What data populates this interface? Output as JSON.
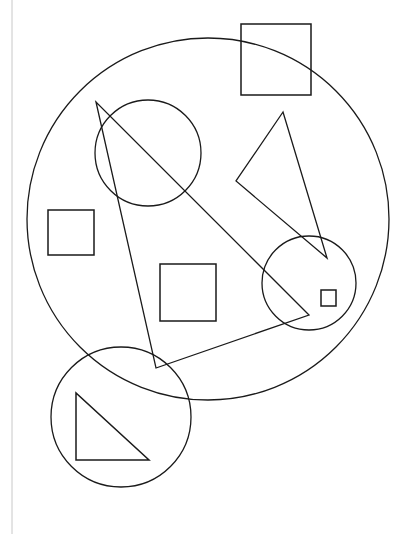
{
  "canvas": {
    "width": 408,
    "height": 534,
    "background_color": "#ffffff",
    "stroke_color": "#1a1a1a",
    "rule_color": "#c8c8c8"
  },
  "margin_rule": {
    "name": "left-margin-rule",
    "x": 12,
    "y1": 0,
    "y2": 534,
    "color": "#c8c8c8",
    "width": 1
  },
  "shapes": [
    {
      "id": "outer-circle",
      "type": "circle",
      "label": "large outer circle",
      "cx": 208,
      "cy": 219,
      "r": 181,
      "stroke": "#1a1a1a",
      "stroke_width": 1.3,
      "fill": "none"
    },
    {
      "id": "upper-left-circle",
      "type": "circle",
      "label": "upper left medium circle",
      "cx": 148,
      "cy": 153,
      "r": 53,
      "stroke": "#1a1a1a",
      "stroke_width": 1.3,
      "fill": "none"
    },
    {
      "id": "right-circle",
      "type": "circle",
      "label": "right medium circle",
      "cx": 309,
      "cy": 283,
      "r": 47,
      "stroke": "#1a1a1a",
      "stroke_width": 1.3,
      "fill": "none"
    },
    {
      "id": "bottom-left-circle",
      "type": "circle",
      "label": "bottom left medium circle",
      "cx": 121,
      "cy": 417,
      "r": 70,
      "stroke": "#1a1a1a",
      "stroke_width": 1.3,
      "fill": "none"
    },
    {
      "id": "top-right-square",
      "type": "rect",
      "label": "top right large square",
      "x": 241,
      "y": 24,
      "width": 70,
      "height": 71,
      "stroke": "#1a1a1a",
      "stroke_width": 1.5,
      "fill": "none"
    },
    {
      "id": "left-square",
      "type": "rect",
      "label": "left small square",
      "x": 48,
      "y": 210,
      "width": 46,
      "height": 45,
      "stroke": "#1a1a1a",
      "stroke_width": 1.5,
      "fill": "none"
    },
    {
      "id": "center-square",
      "type": "rect",
      "label": "center medium square",
      "x": 160,
      "y": 264,
      "width": 56,
      "height": 57,
      "stroke": "#1a1a1a",
      "stroke_width": 1.5,
      "fill": "none"
    },
    {
      "id": "tiny-square",
      "type": "rect",
      "label": "tiny square inside right circle",
      "x": 321,
      "y": 290,
      "width": 15,
      "height": 16,
      "stroke": "#1a1a1a",
      "stroke_width": 1.5,
      "fill": "none"
    },
    {
      "id": "large-thin-triangle",
      "type": "polygon",
      "label": "large thin triangle spanning the figure",
      "points": "96,102 156,368 309,315",
      "stroke": "#1a1a1a",
      "stroke_width": 1.3,
      "fill": "none"
    },
    {
      "id": "right-triangle-shape",
      "type": "polygon",
      "label": "right narrow triangle",
      "points": "283,112 236,181 327,258",
      "stroke": "#1a1a1a",
      "stroke_width": 1.3,
      "fill": "none"
    },
    {
      "id": "bottom-right-triangle",
      "type": "polygon",
      "label": "right-angled triangle inside bottom circle",
      "points": "76,393 76,460 149,460",
      "stroke": "#1a1a1a",
      "stroke_width": 1.5,
      "fill": "none"
    }
  ],
  "counts": {
    "circles": "4",
    "squares": "4",
    "triangles": "3",
    "total_shapes": "11"
  }
}
